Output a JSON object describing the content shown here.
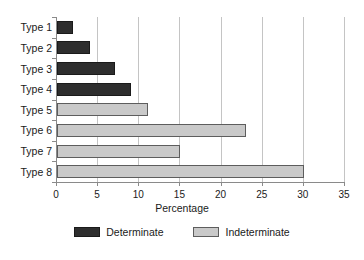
{
  "chart_data": {
    "type": "bar",
    "orientation": "horizontal",
    "title": "",
    "xlabel": "Percentage",
    "ylabel": "",
    "xlim": [
      0,
      35
    ],
    "xticks": [
      0,
      5,
      10,
      15,
      20,
      25,
      30,
      35
    ],
    "xticklabels": [
      "0",
      "5",
      "10",
      "15",
      "20",
      "25",
      "30",
      "35"
    ],
    "categories": [
      "Type 1",
      "Type 2",
      "Type 3",
      "Type 4",
      "Type 5",
      "Type 6",
      "Type 7",
      "Type 8"
    ],
    "values": [
      2,
      4,
      7,
      9,
      11,
      23,
      15,
      30
    ],
    "groups": [
      "Determinate",
      "Determinate",
      "Determinate",
      "Determinate",
      "Indeterminate",
      "Indeterminate",
      "Indeterminate",
      "Indeterminate"
    ],
    "grid": "vertical",
    "legend_position": "bottom",
    "legend": [
      {
        "label": "Determinate",
        "color": "#2e2e2e"
      },
      {
        "label": "Indeterminate",
        "color": "#c9c9c9"
      }
    ],
    "colors": {
      "determinate": "#2e2e2e",
      "indeterminate": "#c9c9c9",
      "gridline": "#c4c4c4",
      "axis": "#8a8a8a",
      "text": "#1a1a1a"
    }
  }
}
